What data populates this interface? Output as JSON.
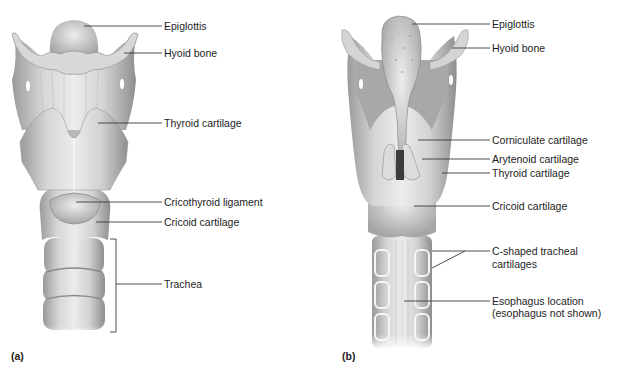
{
  "figure": {
    "panels": [
      {
        "id": "a",
        "tag": "(a)",
        "view": "anterior",
        "labels": [
          {
            "text": "Epiglottis"
          },
          {
            "text": "Hyoid bone"
          },
          {
            "text": "Thyroid cartilage"
          },
          {
            "text": "Cricothyroid ligament"
          },
          {
            "text": "Cricoid cartilage"
          },
          {
            "text": "Trachea"
          }
        ]
      },
      {
        "id": "b",
        "tag": "(b)",
        "view": "posterior",
        "labels": [
          {
            "text": "Epiglottis"
          },
          {
            "text": "Hyoid bone"
          },
          {
            "text": "Corniculate cartilage"
          },
          {
            "text": "Arytenoid cartilage"
          },
          {
            "text": "Thyroid cartilage"
          },
          {
            "text": "Cricoid cartilage"
          },
          {
            "text": "C-shaped tracheal"
          },
          {
            "text": "cartilages"
          },
          {
            "text": "Esophagus location"
          },
          {
            "text": "(esophagus not shown)"
          }
        ]
      }
    ],
    "colors": {
      "tissue_light": "#e6e6e6",
      "tissue_mid": "#c9c9c9",
      "tissue_dark": "#8f8f8f",
      "text": "#1d1d1d",
      "leader": "#3a3a3a"
    }
  }
}
